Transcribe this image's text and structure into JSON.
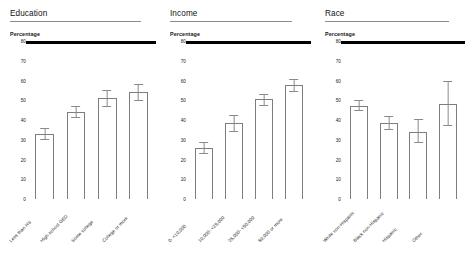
{
  "chart_data": [
    {
      "type": "bar",
      "title": "Education",
      "ylabel": "Percentage",
      "xlabel": "",
      "ylim": [
        0,
        80
      ],
      "yticks": [
        0,
        10,
        20,
        30,
        40,
        50,
        60,
        70,
        80
      ],
      "grid": false,
      "legend": "none",
      "categories": [
        "Less than HS",
        "High school GED",
        "Some college",
        "College or more"
      ],
      "values": [
        33,
        44,
        51,
        54
      ],
      "error_low": [
        30,
        41,
        47,
        50
      ],
      "error_high": [
        36,
        47,
        55,
        58
      ]
    },
    {
      "type": "bar",
      "title": "Income",
      "ylabel": "Percentage",
      "xlabel": "",
      "ylim": [
        0,
        80
      ],
      "yticks": [
        0,
        10,
        20,
        30,
        40,
        50,
        60,
        70,
        80
      ],
      "grid": false,
      "legend": "none",
      "categories": [
        "0- <10,000",
        "10,000- <25,000",
        "25,000- <50,000",
        "50,000 or more"
      ],
      "values": [
        26,
        38.5,
        50.5,
        57.5
      ],
      "error_low": [
        23,
        34,
        47.5,
        54.5
      ],
      "error_high": [
        29,
        42.5,
        53,
        61
      ]
    },
    {
      "type": "bar",
      "title": "Race",
      "ylabel": "Percentage",
      "xlabel": "",
      "ylim": [
        0,
        80
      ],
      "yticks": [
        0,
        10,
        20,
        30,
        40,
        50,
        60,
        70,
        80
      ],
      "grid": false,
      "legend": "none",
      "categories": [
        "White non-Hispanic",
        "Black non-Hispanic",
        "Hispanic",
        "Other"
      ],
      "values": [
        47,
        38.5,
        34,
        48
      ],
      "error_low": [
        44.5,
        35,
        28.5,
        37
      ],
      "error_high": [
        50,
        42,
        40.5,
        60
      ]
    }
  ],
  "panels": [
    {
      "title": "Education",
      "ylabel": "Percentage"
    },
    {
      "title": "Income",
      "ylabel": "Percentage"
    },
    {
      "title": "Race",
      "ylabel": "Percentage"
    }
  ]
}
